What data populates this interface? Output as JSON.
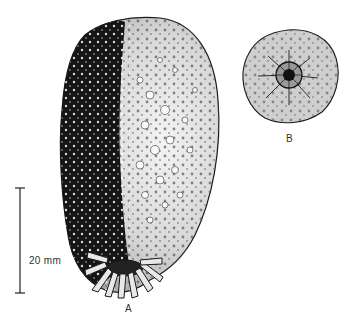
{
  "figure": {
    "specimen_a": {
      "label": "A"
    },
    "specimen_b": {
      "label": "B"
    },
    "scale_bar": {
      "text": "20 mm"
    }
  },
  "colors": {
    "ink": "#1a1a1a",
    "paper": "#ffffff",
    "stipple": "#555555"
  }
}
